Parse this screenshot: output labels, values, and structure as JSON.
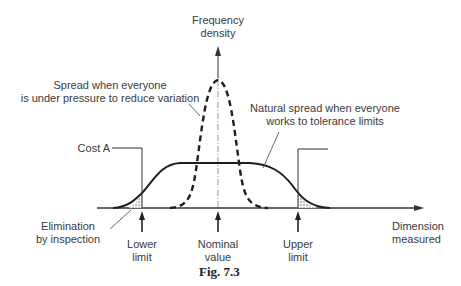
{
  "axes": {
    "y_label_line1": "Frequency",
    "y_label_line2": "density",
    "x_label_line1": "Dimension",
    "x_label_line2": "measured"
  },
  "annotations": {
    "narrow_spread_line1": "Spread when everyone",
    "narrow_spread_line2": "is under pressure to reduce variation",
    "natural_spread_line1": "Natural spread when everyone",
    "natural_spread_line2": "works to tolerance limits",
    "cost": "Cost A",
    "elimination_line1": "Elimination",
    "elimination_line2": "by inspection"
  },
  "markers": {
    "lower_line1": "Lower",
    "lower_line2": "limit",
    "nominal_line1": "Nominal",
    "nominal_line2": "value",
    "upper_line1": "Upper",
    "upper_line2": "limit"
  },
  "caption": "Fig.  7.3",
  "colors": {
    "line": "#222222",
    "text": "#3a3a3a"
  }
}
